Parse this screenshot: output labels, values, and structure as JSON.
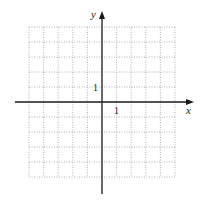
{
  "diagram": {
    "type": "coordinate-grid",
    "x_axis_label": "x",
    "y_axis_label": "y",
    "x_tick_label": "1",
    "y_tick_label": "1",
    "grid": {
      "x_min": -5,
      "x_max": 5,
      "y_min": -5,
      "y_max": 5,
      "style": "dotted"
    },
    "colors": {
      "axis": "#1a1a1a",
      "grid": "#9a9a9a",
      "background": "#ffffff"
    }
  }
}
